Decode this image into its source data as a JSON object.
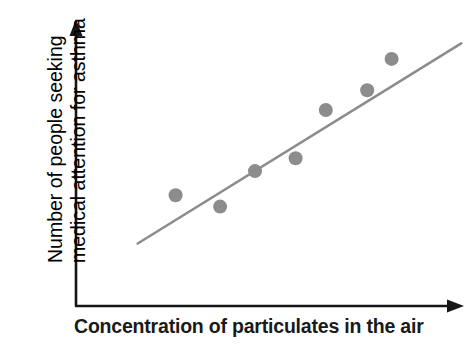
{
  "chart_data": {
    "type": "scatter",
    "title": "",
    "subtitle": "",
    "xlabel": "Concentration of particulates in the air",
    "ylabel": "Number of people seeking medical attention for asthma",
    "ylabel_lines": [
      "Number of people seeking",
      "medical attention for asthma"
    ],
    "xtick_labels": [],
    "ytick_labels": [],
    "xlim": [
      0,
      10
    ],
    "ylim": [
      0,
      10
    ],
    "grid": false,
    "legend": null,
    "legend_position": "none",
    "annotations": [],
    "axes_style": {
      "arrow_heads": true,
      "ticks": false,
      "tick_labels": false,
      "color": "#161616",
      "line_width": 2.4
    },
    "series": [
      {
        "name": "Asthma cases vs particulates",
        "marker": "circle",
        "marker_color": "#8c8c8c",
        "marker_size": 14,
        "points": [
          {
            "x": 2.6,
            "y": 3.9
          },
          {
            "x": 3.75,
            "y": 3.5
          },
          {
            "x": 4.65,
            "y": 4.75
          },
          {
            "x": 5.7,
            "y": 5.2
          },
          {
            "x": 6.48,
            "y": 6.9
          },
          {
            "x": 7.55,
            "y": 7.6
          },
          {
            "x": 8.18,
            "y": 8.7
          }
        ]
      },
      {
        "name": "Line of best fit",
        "type": "trendline",
        "line_color": "#8c8c8c",
        "line_width": 2.6,
        "start": {
          "x": 1.62,
          "y": 2.2
        },
        "end": {
          "x": 9.98,
          "y": 9.25
        }
      }
    ]
  },
  "axis_labels": {
    "x": "Concentration of particulates in the air",
    "y_line_1": "Number of people seeking",
    "y_line_2": "medical attention for asthma"
  },
  "colors": {
    "background": "#ffffff",
    "axis": "#161616",
    "marker": "#8c8c8c",
    "trendline": "#8c8c8c",
    "text": "#1a1a1a"
  },
  "geometry": {
    "origin_px": {
      "x": 75,
      "y": 306
    },
    "x_axis_end_px": {
      "x": 462,
      "y": 306
    },
    "y_axis_top_px": {
      "x": 76,
      "y": 22
    },
    "plot_width_px": 387,
    "plot_height_px": 284
  }
}
